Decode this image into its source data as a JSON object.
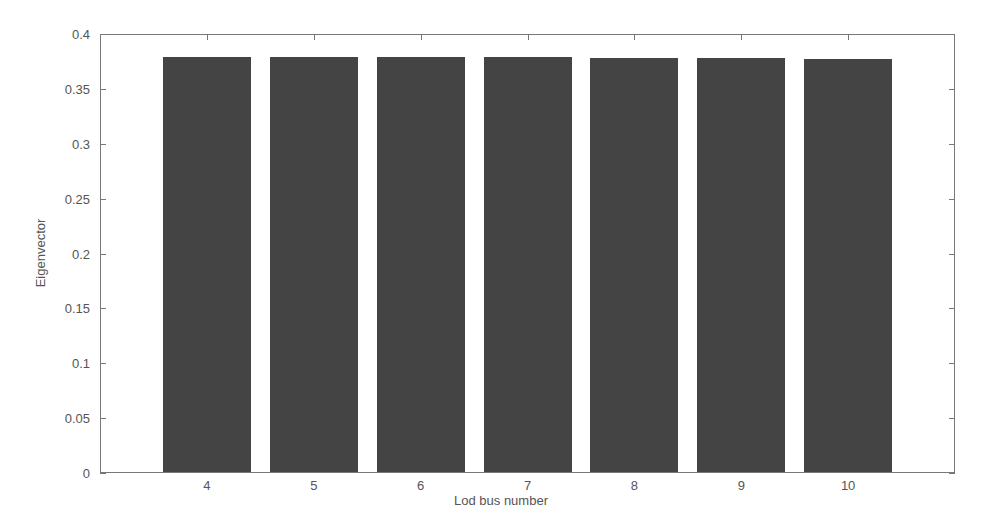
{
  "chart_data": {
    "type": "bar",
    "title": "",
    "xlabel": "Lod bus number",
    "ylabel": "Eigenvector",
    "categories": [
      "4",
      "5",
      "6",
      "7",
      "8",
      "9",
      "10"
    ],
    "values": [
      0.3786,
      0.3786,
      0.3784,
      0.378,
      0.3776,
      0.377,
      0.3763
    ],
    "ylim": [
      0,
      0.4
    ],
    "yticks": [
      "0",
      "0.05",
      "0.1",
      "0.15",
      "0.2",
      "0.25",
      "0.3",
      "0.35",
      "0.4"
    ],
    "grid": false,
    "legend": null,
    "bar_color": "#444444"
  }
}
